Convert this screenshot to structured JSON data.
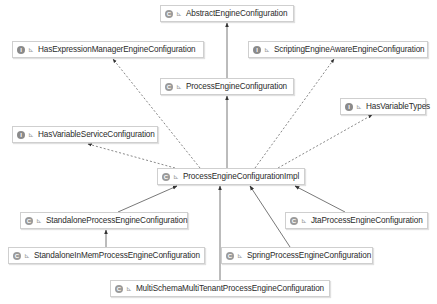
{
  "diagram": {
    "type": "uml-class-hierarchy",
    "nodes": [
      {
        "id": "n0",
        "name": "AbstractEngineConfiguration",
        "kind": "C",
        "x": 160,
        "y": 5,
        "w": 134
      },
      {
        "id": "n1",
        "name": "HasExpressionManagerEngineConfiguration",
        "kind": "I",
        "x": 12,
        "y": 41,
        "w": 192
      },
      {
        "id": "n2",
        "name": "ScriptingEngineAwareEngineConfiguration",
        "kind": "I",
        "x": 248,
        "y": 41,
        "w": 180
      },
      {
        "id": "n3",
        "name": "ProcessEngineConfiguration",
        "kind": "C",
        "x": 160,
        "y": 78,
        "w": 134
      },
      {
        "id": "n4",
        "name": "HasVariableTypes",
        "kind": "I",
        "x": 340,
        "y": 98,
        "w": 86
      },
      {
        "id": "n5",
        "name": "HasVariableServiceConfiguration",
        "kind": "I",
        "x": 12,
        "y": 126,
        "w": 146
      },
      {
        "id": "n6",
        "name": "ProcessEngineConfigurationImpl",
        "kind": "C",
        "x": 157,
        "y": 168,
        "w": 148
      },
      {
        "id": "n7",
        "name": "StandaloneProcessEngineConfiguration",
        "kind": "C",
        "x": 20,
        "y": 212,
        "w": 168
      },
      {
        "id": "n8",
        "name": "JtaProcessEngineConfiguration",
        "kind": "C",
        "x": 285,
        "y": 212,
        "w": 143
      },
      {
        "id": "n9",
        "name": "StandaloneInMemProcessEngineConfiguration",
        "kind": "C",
        "x": 8,
        "y": 247,
        "w": 197
      },
      {
        "id": "n10",
        "name": "SpringProcessEngineConfiguration",
        "kind": "C",
        "x": 221,
        "y": 247,
        "w": 152
      },
      {
        "id": "n11",
        "name": "MultiSchemaMultiTenantProcessEngineConfiguration",
        "kind": "C",
        "x": 110,
        "y": 280,
        "w": 220
      }
    ],
    "edges": [
      {
        "from": "n3",
        "to": "n0",
        "style": "solid",
        "x1": 227,
        "y1": 78,
        "x2": 227,
        "y2": 23
      },
      {
        "from": "n6",
        "to": "n3",
        "style": "solid",
        "x1": 227,
        "y1": 168,
        "x2": 227,
        "y2": 96
      },
      {
        "from": "n6",
        "to": "n1",
        "style": "dashed",
        "x1": 200,
        "y1": 168,
        "x2": 113,
        "y2": 59
      },
      {
        "from": "n6",
        "to": "n2",
        "style": "dashed",
        "x1": 255,
        "y1": 168,
        "x2": 334,
        "y2": 59
      },
      {
        "from": "n6",
        "to": "n4",
        "style": "dashed",
        "x1": 278,
        "y1": 168,
        "x2": 372,
        "y2": 115
      },
      {
        "from": "n6",
        "to": "n5",
        "style": "dashed",
        "x1": 175,
        "y1": 168,
        "x2": 88,
        "y2": 144
      },
      {
        "from": "n7",
        "to": "n6",
        "style": "solid",
        "x1": 118,
        "y1": 212,
        "x2": 177,
        "y2": 186
      },
      {
        "from": "n9",
        "to": "n7",
        "style": "solid",
        "x1": 106,
        "y1": 247,
        "x2": 106,
        "y2": 230
      },
      {
        "from": "n8",
        "to": "n6",
        "style": "solid",
        "x1": 345,
        "y1": 212,
        "x2": 295,
        "y2": 186
      },
      {
        "from": "n10",
        "to": "n6",
        "style": "solid",
        "x1": 290,
        "y1": 247,
        "x2": 250,
        "y2": 186
      },
      {
        "from": "n11",
        "to": "n6",
        "style": "solid",
        "x1": 220,
        "y1": 280,
        "x2": 220,
        "y2": 186
      }
    ],
    "colors": {
      "edge": "#555555",
      "node_border": "#cfcfcf",
      "node_bg": "#ffffff",
      "text": "#2b2b2b",
      "icon": "#9a9a9a"
    },
    "legend": {
      "class_icon": "C",
      "interface_icon": "I",
      "visibility_glyph": "⊾"
    }
  }
}
